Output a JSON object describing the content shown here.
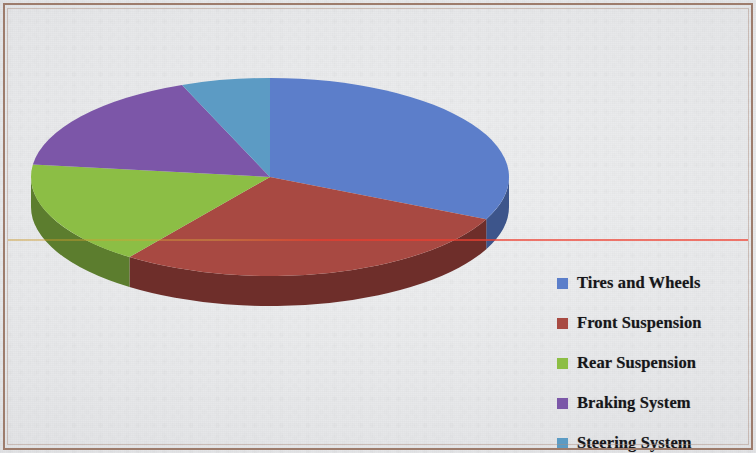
{
  "chart_data": {
    "type": "pie",
    "title": "",
    "subtitle": "",
    "three_d": true,
    "legend_position": "right",
    "categories": [
      "Tires and Wheels",
      "Front Suspension",
      "Rear Suspension",
      "Braking System",
      "Steering System"
    ],
    "values": [
      32,
      28,
      17,
      17,
      6
    ],
    "colors": [
      "#5B7ECA",
      "#A84A42",
      "#8CBE44",
      "#7B57A8",
      "#5B9BC4"
    ],
    "side_colors": [
      "#3C548B",
      "#6E2F2B",
      "#5C7D2D",
      "#513970",
      "#3C6785"
    ],
    "start_angle_deg": 0,
    "direction": "clockwise",
    "slices": [
      {
        "label": "Tires and Wheels",
        "value": 32,
        "color": "#5B7ECA"
      },
      {
        "label": "Front Suspension",
        "value": 28,
        "color": "#A84A42"
      },
      {
        "label": "Rear Suspension",
        "value": 17,
        "color": "#8CBE44"
      },
      {
        "label": "Braking System",
        "value": 17,
        "color": "#7B57A8"
      },
      {
        "label": "Steering System",
        "value": 6,
        "color": "#5B9BC4"
      }
    ]
  },
  "legend": {
    "items": [
      {
        "label": "Tires and Wheels",
        "color": "#5B7ECA",
        "icon": "legend-swatch-icon"
      },
      {
        "label": "Front Suspension",
        "color": "#A84A42",
        "icon": "legend-swatch-icon"
      },
      {
        "label": "Rear Suspension",
        "color": "#8CBE44",
        "icon": "legend-swatch-icon"
      },
      {
        "label": "Braking System",
        "color": "#7B57A8",
        "icon": "legend-swatch-icon"
      },
      {
        "label": "Steering System",
        "color": "#5B9BC4",
        "icon": "legend-swatch-icon"
      }
    ]
  },
  "page": {
    "background": "#e6e7e9",
    "frame_color": "#9d7c6c",
    "scanline_color": "#eb3c2d"
  },
  "ghost_text": {
    "line1": "",
    "line2": ""
  }
}
